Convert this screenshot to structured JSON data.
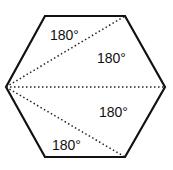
{
  "diagram": {
    "shape": "hexagon",
    "vertices": [
      [
        45,
        16
      ],
      [
        125,
        16
      ],
      [
        165,
        87
      ],
      [
        125,
        157
      ],
      [
        45,
        157
      ],
      [
        6,
        87
      ]
    ],
    "diagonals_from": [
      6,
      87
    ],
    "diagonals_to": [
      [
        125,
        16
      ],
      [
        165,
        87
      ],
      [
        125,
        157
      ]
    ],
    "triangle_labels": [
      {
        "text": "180°",
        "x": 50,
        "y": 40
      },
      {
        "text": "180°",
        "x": 97,
        "y": 63
      },
      {
        "text": "180°",
        "x": 99,
        "y": 117
      },
      {
        "text": "180°",
        "x": 52,
        "y": 150
      }
    ],
    "colors": {
      "outline": "#111111",
      "diagonal": "#222222",
      "background": "#ffffff"
    }
  }
}
